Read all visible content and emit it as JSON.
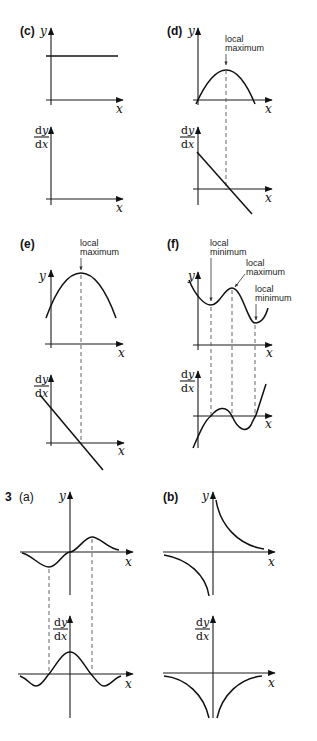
{
  "question_number": "3",
  "axis_labels": {
    "x": "x",
    "y": "y",
    "dy": "dy",
    "dx": "dx",
    "d": "d"
  },
  "panels": {
    "c": {
      "label": "(c)"
    },
    "d": {
      "label": "(d)",
      "annotations": [
        "local",
        "maximum"
      ]
    },
    "e": {
      "label": "(e)",
      "annotations": [
        "local",
        "maximum"
      ]
    },
    "f": {
      "label": "(f)",
      "annotations": {
        "min1": [
          "local",
          "minimum"
        ],
        "max": [
          "local",
          "maximum"
        ],
        "min2": [
          "local",
          "minimum"
        ]
      }
    },
    "a3": {
      "label": "(a)"
    },
    "b3": {
      "label": "(b)"
    }
  },
  "colors": {
    "ink": "#111111",
    "dash": "#555555",
    "background": "#ffffff"
  }
}
